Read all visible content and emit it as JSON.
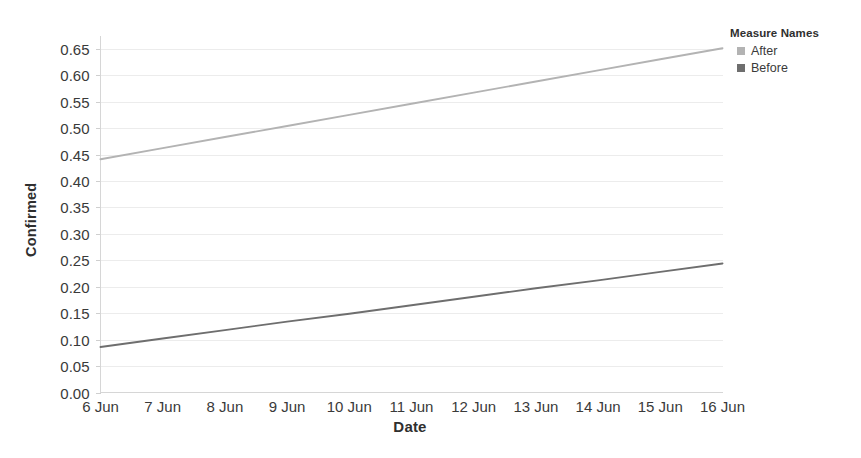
{
  "chart_data": {
    "type": "line",
    "title": "",
    "xlabel": "Date",
    "ylabel": "Confirmed",
    "x": [
      "6 Jun",
      "7 Jun",
      "8 Jun",
      "9 Jun",
      "10 Jun",
      "11 Jun",
      "12 Jun",
      "13 Jun",
      "14 Jun",
      "15 Jun",
      "16 Jun"
    ],
    "categories": [
      "6 Jun",
      "7 Jun",
      "8 Jun",
      "9 Jun",
      "10 Jun",
      "11 Jun",
      "12 Jun",
      "13 Jun",
      "14 Jun",
      "15 Jun",
      "16 Jun"
    ],
    "series": [
      {
        "name": "After",
        "color": "#b3b3b3",
        "values": [
          0.441,
          0.462,
          0.483,
          0.504,
          0.525,
          0.546,
          0.567,
          0.588,
          0.609,
          0.63,
          0.651
        ]
      },
      {
        "name": "Before",
        "color": "#6e6e6e",
        "values": [
          0.086,
          0.102,
          0.118,
          0.134,
          0.149,
          0.165,
          0.181,
          0.197,
          0.212,
          0.228,
          0.244
        ]
      }
    ],
    "ylim": [
      0.0,
      0.675
    ],
    "yticks": [
      0.0,
      0.05,
      0.1,
      0.15,
      0.2,
      0.25,
      0.3,
      0.35,
      0.4,
      0.45,
      0.5,
      0.55,
      0.6,
      0.65
    ],
    "ytick_labels": [
      "0.00",
      "0.05",
      "0.10",
      "0.15",
      "0.20",
      "0.25",
      "0.30",
      "0.35",
      "0.40",
      "0.45",
      "0.50",
      "0.55",
      "0.60",
      "0.65"
    ],
    "grid": true,
    "legend_position": "right"
  },
  "legend": {
    "title": "Measure Names",
    "items": [
      {
        "label": "After",
        "color": "#b3b3b3"
      },
      {
        "label": "Before",
        "color": "#6e6e6e"
      }
    ]
  },
  "axes": {
    "y_title": "Confirmed",
    "x_title": "Date"
  }
}
